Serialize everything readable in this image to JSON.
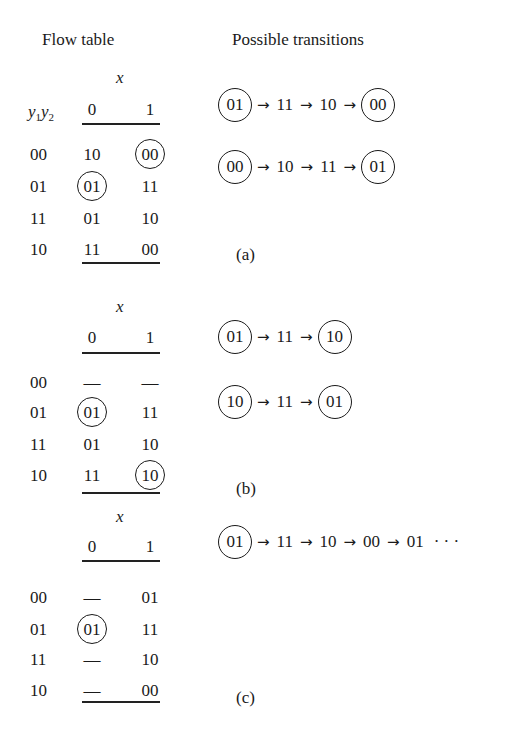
{
  "headers": {
    "flow_table": "Flow table",
    "transitions": "Possible transitions"
  },
  "row_header": {
    "var1": "y",
    "sub1": "1",
    "var2": "y",
    "sub2": "2"
  },
  "tables": [
    {
      "id": "a",
      "input_label": "x",
      "columns": [
        "0",
        "1"
      ],
      "rows": [
        {
          "state": "00",
          "cells": [
            {
              "v": "10",
              "stable": false
            },
            {
              "v": "00",
              "stable": true
            }
          ]
        },
        {
          "state": "01",
          "cells": [
            {
              "v": "01",
              "stable": true
            },
            {
              "v": "11",
              "stable": false
            }
          ]
        },
        {
          "state": "11",
          "cells": [
            {
              "v": "01",
              "stable": false
            },
            {
              "v": "10",
              "stable": false
            }
          ]
        },
        {
          "state": "10",
          "cells": [
            {
              "v": "11",
              "stable": false
            },
            {
              "v": "00",
              "stable": false
            }
          ]
        }
      ],
      "transitions": [
        [
          {
            "v": "01",
            "circled": true
          },
          {
            "v": "11"
          },
          {
            "v": "10"
          },
          {
            "v": "00",
            "circled": true
          }
        ],
        [
          {
            "v": "00",
            "circled": true
          },
          {
            "v": "10"
          },
          {
            "v": "11"
          },
          {
            "v": "01",
            "circled": true
          }
        ]
      ],
      "caption": "(a)"
    },
    {
      "id": "b",
      "input_label": "x",
      "columns": [
        "0",
        "1"
      ],
      "rows": [
        {
          "state": "00",
          "cells": [
            {
              "v": "—",
              "stable": false
            },
            {
              "v": "—",
              "stable": false
            }
          ]
        },
        {
          "state": "01",
          "cells": [
            {
              "v": "01",
              "stable": true
            },
            {
              "v": "11",
              "stable": false
            }
          ]
        },
        {
          "state": "11",
          "cells": [
            {
              "v": "01",
              "stable": false
            },
            {
              "v": "10",
              "stable": false
            }
          ]
        },
        {
          "state": "10",
          "cells": [
            {
              "v": "11",
              "stable": false
            },
            {
              "v": "10",
              "stable": true
            }
          ]
        }
      ],
      "transitions": [
        [
          {
            "v": "01",
            "circled": true
          },
          {
            "v": "11"
          },
          {
            "v": "10",
            "circled": true
          }
        ],
        [
          {
            "v": "10",
            "circled": true
          },
          {
            "v": "11"
          },
          {
            "v": "01",
            "circled": true
          }
        ]
      ],
      "caption": "(b)"
    },
    {
      "id": "c",
      "input_label": "x",
      "columns": [
        "0",
        "1"
      ],
      "rows": [
        {
          "state": "00",
          "cells": [
            {
              "v": "—",
              "stable": false
            },
            {
              "v": "01",
              "stable": false
            }
          ]
        },
        {
          "state": "01",
          "cells": [
            {
              "v": "01",
              "stable": true
            },
            {
              "v": "11",
              "stable": false
            }
          ]
        },
        {
          "state": "11",
          "cells": [
            {
              "v": "—",
              "stable": false
            },
            {
              "v": "10",
              "stable": false
            }
          ]
        },
        {
          "state": "10",
          "cells": [
            {
              "v": "—",
              "stable": false
            },
            {
              "v": "00",
              "stable": false
            }
          ]
        }
      ],
      "transitions": [
        [
          {
            "v": "01",
            "circled": true
          },
          {
            "v": "11"
          },
          {
            "v": "10"
          },
          {
            "v": "00"
          },
          {
            "v": "01"
          },
          {
            "v": "· · ·",
            "noarrow": true
          }
        ]
      ],
      "caption": "(c)"
    }
  ],
  "arrow_glyph": "→"
}
